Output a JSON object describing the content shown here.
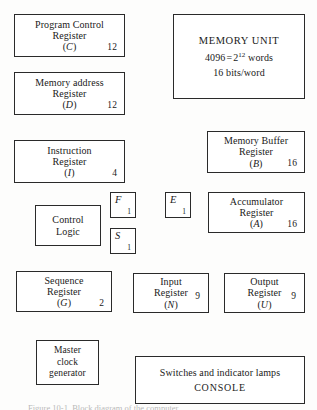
{
  "figure": {
    "caption": "Figure 10-1.  Block diagram of the computer."
  },
  "blocks": {
    "program_control_register": {
      "line1": "Program Control",
      "line2": "Register",
      "symbol": "C",
      "width": "12"
    },
    "memory_address_register": {
      "line1": "Memory address",
      "line2": "Register",
      "symbol": "D",
      "width": "12"
    },
    "instruction_register": {
      "line1": "Instruction",
      "line2": "Register",
      "symbol": "I",
      "width": "4"
    },
    "memory_unit": {
      "title": "MEMORY UNIT",
      "words_value": "4096",
      "equals": "=",
      "base": "2",
      "exponent": "12",
      "words_label": "words",
      "bits": "16 bits/word"
    },
    "memory_buffer_register": {
      "line1": "Memory Buffer",
      "line2": "Register",
      "symbol": "B",
      "width": "16"
    },
    "accumulator_register": {
      "line1": "Accumulator",
      "line2": "Register",
      "symbol": "A",
      "width": "16"
    },
    "control_logic": {
      "line1": "Control",
      "line2": "Logic"
    },
    "flag_f": {
      "symbol": "F",
      "width": "1"
    },
    "flag_s": {
      "symbol": "S",
      "width": "1"
    },
    "flag_e": {
      "symbol": "E",
      "width": "1"
    },
    "sequence_register": {
      "line1": "Sequence",
      "line2": "Register",
      "symbol": "G",
      "width": "2"
    },
    "input_register": {
      "line1": "Input",
      "line2": "Register",
      "symbol": "N",
      "width": "9"
    },
    "output_register": {
      "line1": "Output",
      "line2": "Register",
      "symbol": "U",
      "width": "9"
    },
    "master_clock": {
      "line1": "Master",
      "line2": "clock",
      "line3": "generator"
    },
    "console": {
      "line1": "Switches and indicator lamps",
      "line2": "CONSOLE"
    }
  },
  "glyphs": {
    "paren_open": "(",
    "paren_close": ")"
  }
}
